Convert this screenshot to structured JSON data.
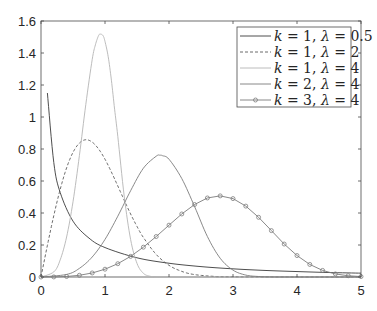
{
  "chart_data": {
    "type": "line",
    "title": "",
    "xlabel": "",
    "ylabel": "",
    "xlim": [
      0,
      5
    ],
    "ylim": [
      0,
      1.6
    ],
    "grid": false,
    "legend_position": "upper right",
    "x_ticks": [
      0,
      1,
      2,
      3,
      4,
      5
    ],
    "x_tick_labels": [
      "0",
      "1",
      "2",
      "3",
      "4",
      "5"
    ],
    "y_ticks": [
      0,
      0.2,
      0.4,
      0.6,
      0.8,
      1.0,
      1.2,
      1.4,
      1.6
    ],
    "y_tick_labels": [
      "0",
      "0.2",
      "0.4",
      "0.6",
      "0.8",
      "1",
      "1.2",
      "1.4",
      "1.6"
    ],
    "series": [
      {
        "name": "k = 1, λ = 0.5",
        "k": "1",
        "lambda": "0.5",
        "color": "#3a3a3a",
        "style": "solid",
        "marker": "none",
        "x": [
          0.1,
          0.2,
          0.3,
          0.5,
          0.75,
          1.0,
          1.5,
          2.0,
          2.5,
          3.0,
          3.5,
          4.0,
          4.5,
          5.0
        ],
        "y": [
          1.15,
          0.715,
          0.528,
          0.349,
          0.243,
          0.184,
          0.12,
          0.086,
          0.065,
          0.051,
          0.041,
          0.034,
          0.028,
          0.024
        ]
      },
      {
        "name": "k = 1, λ = 2",
        "k": "1",
        "lambda": "2",
        "color": "#5a5a5a",
        "style": "dashed",
        "marker": "none",
        "x": [
          0,
          0.1,
          0.2,
          0.3,
          0.4,
          0.5,
          0.6,
          0.7,
          0.8,
          0.9,
          1.0,
          1.1,
          1.2,
          1.3,
          1.4,
          1.5,
          1.6,
          1.8,
          2.0,
          2.2,
          2.4,
          2.7,
          3.0,
          5.0
        ],
        "y": [
          0,
          0.198,
          0.384,
          0.548,
          0.682,
          0.779,
          0.837,
          0.858,
          0.843,
          0.8,
          0.736,
          0.656,
          0.569,
          0.48,
          0.394,
          0.316,
          0.247,
          0.141,
          0.073,
          0.035,
          0.015,
          0.004,
          0.001,
          0
        ]
      },
      {
        "name": "k = 1, λ = 4",
        "k": "1",
        "lambda": "4",
        "color": "#b4b4b4",
        "style": "solid",
        "marker": "none",
        "x": [
          0,
          0.2,
          0.3,
          0.4,
          0.5,
          0.6,
          0.7,
          0.8,
          0.85,
          0.9,
          0.93,
          0.97,
          1.0,
          1.05,
          1.1,
          1.15,
          1.2,
          1.3,
          1.4,
          1.5,
          1.6,
          1.7,
          1.8,
          2.0,
          5.0
        ],
        "y": [
          0,
          0.032,
          0.107,
          0.25,
          0.47,
          0.759,
          1.078,
          1.359,
          1.451,
          1.509,
          1.518,
          1.508,
          1.472,
          1.377,
          1.23,
          1.049,
          0.879,
          0.506,
          0.235,
          0.085,
          0.023,
          0.005,
          0.001,
          0,
          0
        ]
      },
      {
        "name": "k = 2, λ = 4",
        "k": "2",
        "lambda": "4",
        "color": "#7c7c7c",
        "style": "solid",
        "marker": "none",
        "x": [
          0,
          0.4,
          0.6,
          0.8,
          1.0,
          1.2,
          1.4,
          1.6,
          1.8,
          1.86,
          1.9,
          2.0,
          2.2,
          2.4,
          2.6,
          2.8,
          3.0,
          3.2,
          3.4,
          3.6,
          4.0,
          5.0
        ],
        "y": [
          0,
          0.016,
          0.054,
          0.125,
          0.235,
          0.38,
          0.539,
          0.68,
          0.755,
          0.761,
          0.758,
          0.736,
          0.615,
          0.44,
          0.253,
          0.117,
          0.043,
          0.012,
          0.003,
          0.0005,
          0,
          0
        ]
      },
      {
        "name": "k = 3, λ = 4",
        "k": "3",
        "lambda": "4",
        "color": "#7c7c7c",
        "style": "solid",
        "marker": "circle",
        "x": [
          0,
          0.2,
          0.4,
          0.6,
          0.8,
          1.0,
          1.2,
          1.4,
          1.6,
          1.8,
          2.0,
          2.2,
          2.4,
          2.6,
          2.8,
          3.0,
          3.2,
          3.4,
          3.6,
          3.8,
          4.0,
          4.2,
          4.4,
          4.6,
          4.8,
          5.0
        ],
        "y": [
          0,
          0.0004,
          0.0032,
          0.0107,
          0.0252,
          0.0488,
          0.0832,
          0.129,
          0.1865,
          0.253,
          0.324,
          0.394,
          0.453,
          0.494,
          0.507,
          0.49,
          0.443,
          0.373,
          0.29,
          0.206,
          0.134,
          0.0785,
          0.0412,
          0.0191,
          0.0078,
          0.0028
        ]
      }
    ]
  },
  "legend": {
    "entries": [
      {
        "k_sym": "k",
        "eq": " = 1, ",
        "lam_sym": "λ",
        "eq2": " = 0.5"
      },
      {
        "k_sym": "k",
        "eq": " = 1, ",
        "lam_sym": "λ",
        "eq2": " = 2"
      },
      {
        "k_sym": "k",
        "eq": " = 1, ",
        "lam_sym": "λ",
        "eq2": " = 4"
      },
      {
        "k_sym": "k",
        "eq": " = 2, ",
        "lam_sym": "λ",
        "eq2": " = 4"
      },
      {
        "k_sym": "k",
        "eq": " = 3, ",
        "lam_sym": "λ",
        "eq2": " = 4"
      }
    ]
  }
}
